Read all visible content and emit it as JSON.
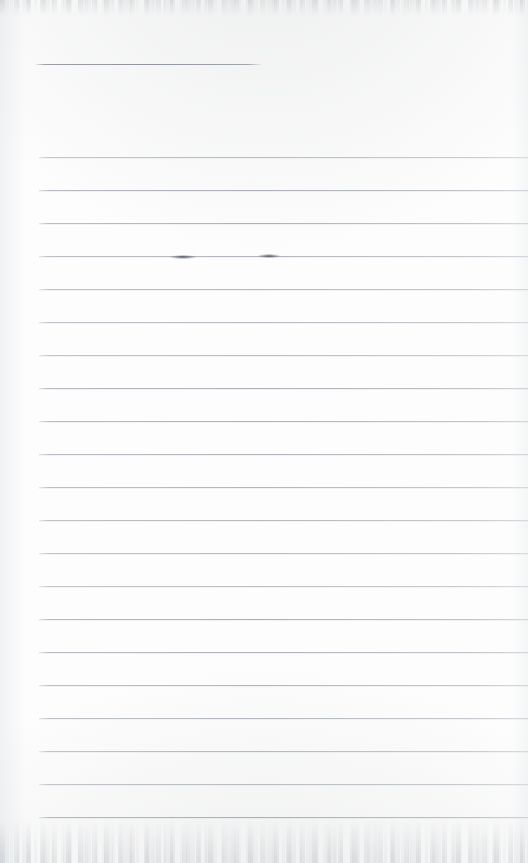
{
  "page": {
    "kind": "scanned-blank-ruled-paper",
    "width": 528,
    "height": 863,
    "background_color": "#fdfdfd",
    "text_content": "",
    "visible_text_count": 0
  },
  "colors": {
    "paper": "#fdfdfd",
    "rule_line": "#acb0b6",
    "header_rule": "#92969c",
    "smudge": "#282c32",
    "scan_edge_grain": "#969ba0"
  },
  "header_rule": {
    "name": "header-rule",
    "x": 36,
    "y": 64,
    "width": 225,
    "thickness": 1
  },
  "ruled_lines": {
    "count": 21,
    "left_x": 39,
    "right_x": 528,
    "spacing": 33,
    "first_y": 157,
    "last_y": 817,
    "y_positions": [
      157,
      190,
      223,
      256,
      289,
      322,
      355,
      388,
      421,
      454,
      487,
      520,
      553,
      586,
      619,
      652,
      685,
      718,
      751,
      784,
      817
    ]
  },
  "marks": [
    {
      "name": "ink-smudge-left",
      "x": 170,
      "y": 255,
      "width": 26,
      "height": 4
    },
    {
      "name": "ink-smudge-right",
      "x": 258,
      "y": 254,
      "width": 22,
      "height": 4
    }
  ],
  "scan_edges": [
    {
      "name": "top-scan-edge",
      "position": "top",
      "height": 16
    },
    {
      "name": "bottom-scan-edge",
      "position": "bottom",
      "height": 44
    }
  ]
}
